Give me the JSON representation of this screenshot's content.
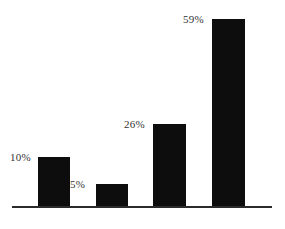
{
  "chart_data": {
    "type": "bar",
    "title": "",
    "subtitle": "",
    "xlabel": "",
    "ylabel": "",
    "categories": [
      "",
      "",
      "",
      ""
    ],
    "values": [
      10,
      5,
      26,
      59
    ],
    "data_labels": [
      "10%",
      "5%",
      "26%",
      "59%"
    ],
    "value_suffix": "%",
    "ylim": [
      0,
      62
    ],
    "grid": false,
    "legend": false,
    "legend_position": "none",
    "axis": {
      "baseline_visible": true,
      "x_tick_labels": [],
      "y_tick_labels": []
    },
    "series": [
      {
        "name": "",
        "values": [
          10,
          5,
          26,
          59
        ]
      }
    ]
  },
  "style": {
    "bar_color": "#0d0d0d",
    "label_color": "#333333",
    "axis_color": "#2b2b2b",
    "background_color": "#ffffff"
  },
  "geometry": {
    "width": 285,
    "height": 229,
    "baseline_y": 206,
    "baseline_left": 12,
    "baseline_right": 272,
    "bars": [
      {
        "left": 38,
        "top": 157,
        "width": 32,
        "height": 49,
        "label_left": 10,
        "label_top": 152
      },
      {
        "left": 96,
        "top": 184,
        "width": 32,
        "height": 22,
        "label_left": 70,
        "label_top": 179
      },
      {
        "left": 153,
        "top": 124,
        "width": 33,
        "height": 82,
        "label_left": 124,
        "label_top": 119
      },
      {
        "left": 212,
        "top": 19,
        "width": 33,
        "height": 187,
        "label_left": 183,
        "label_top": 14
      }
    ]
  }
}
